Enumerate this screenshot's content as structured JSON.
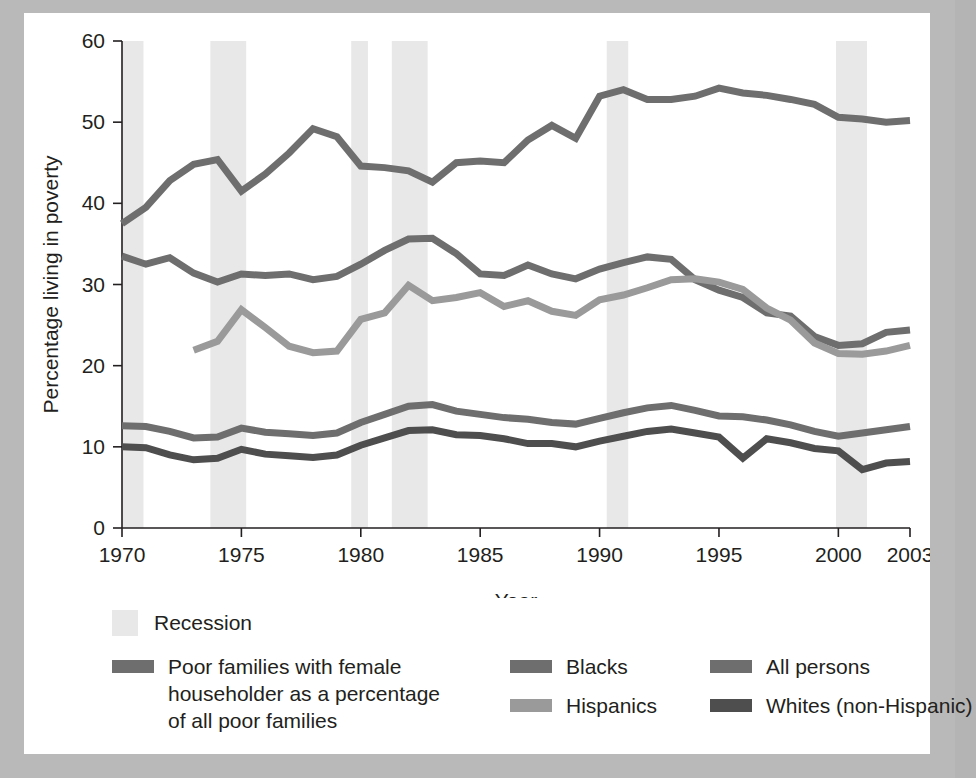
{
  "chart_data": {
    "type": "line",
    "title": "",
    "xlabel": "Year",
    "ylabel": "Percentage living in poverty",
    "xlim": [
      1970,
      2003
    ],
    "ylim": [
      0,
      60
    ],
    "xticks": [
      1970,
      1975,
      1980,
      1985,
      1990,
      1995,
      2000,
      2003
    ],
    "xtick_labels": [
      "1970",
      "1975",
      "1980",
      "1985",
      "1990",
      "1995",
      "2000",
      "2003"
    ],
    "yticks": [
      0,
      10,
      20,
      30,
      40,
      50,
      60
    ],
    "ytick_labels": [
      "0",
      "10",
      "20",
      "30",
      "40",
      "50",
      "60"
    ],
    "grid": false,
    "legend_position": "below",
    "recession_bands": [
      {
        "start": 1970.0,
        "end": 1970.9
      },
      {
        "start": 1973.7,
        "end": 1975.2
      },
      {
        "start": 1979.6,
        "end": 1980.3
      },
      {
        "start": 1981.3,
        "end": 1982.8
      },
      {
        "start": 1990.3,
        "end": 1991.2
      },
      {
        "start": 1999.9,
        "end": 2001.2
      }
    ],
    "series": [
      {
        "name": "Poor families with female householder as a percentage of all poor families",
        "color": "#6e6e6e",
        "x": [
          1970,
          1971,
          1972,
          1973,
          1974,
          1975,
          1976,
          1977,
          1978,
          1979,
          1980,
          1981,
          1982,
          1983,
          1984,
          1985,
          1986,
          1987,
          1988,
          1989,
          1990,
          1991,
          1992,
          1993,
          1994,
          1995,
          1996,
          1997,
          1998,
          1999,
          2000,
          2001,
          2002,
          2003
        ],
        "values": [
          37.5,
          39.5,
          42.8,
          44.8,
          45.4,
          41.5,
          43.6,
          46.2,
          49.2,
          48.2,
          44.6,
          44.4,
          44.0,
          42.6,
          45.0,
          45.2,
          45.0,
          47.8,
          49.6,
          48.0,
          53.2,
          54.0,
          52.8,
          52.8,
          53.2,
          54.2,
          53.6,
          53.3,
          52.8,
          52.2,
          50.6,
          50.4,
          50.0,
          50.2
        ]
      },
      {
        "name": "Blacks",
        "color": "#6e6e6e",
        "x": [
          1970,
          1971,
          1972,
          1973,
          1974,
          1975,
          1976,
          1977,
          1978,
          1979,
          1980,
          1981,
          1982,
          1983,
          1984,
          1985,
          1986,
          1987,
          1988,
          1989,
          1990,
          1991,
          1992,
          1993,
          1994,
          1995,
          1996,
          1997,
          1998,
          1999,
          2000,
          2001,
          2002,
          2003
        ],
        "values": [
          33.5,
          32.5,
          33.3,
          31.4,
          30.3,
          31.3,
          31.1,
          31.3,
          30.6,
          31.0,
          32.5,
          34.2,
          35.6,
          35.7,
          33.8,
          31.3,
          31.1,
          32.4,
          31.3,
          30.7,
          31.9,
          32.7,
          33.4,
          33.1,
          30.6,
          29.3,
          28.4,
          26.5,
          26.1,
          23.6,
          22.5,
          22.7,
          24.1,
          24.4
        ]
      },
      {
        "name": "Hispanics",
        "color": "#9a9a9a",
        "x": [
          1973,
          1974,
          1975,
          1976,
          1977,
          1978,
          1979,
          1980,
          1981,
          1982,
          1983,
          1984,
          1985,
          1986,
          1987,
          1988,
          1989,
          1990,
          1991,
          1992,
          1993,
          1994,
          1995,
          1996,
          1997,
          1998,
          1999,
          2000,
          2001,
          2002,
          2003
        ],
        "values": [
          21.9,
          23.0,
          26.9,
          24.7,
          22.4,
          21.6,
          21.8,
          25.7,
          26.5,
          29.9,
          28.0,
          28.4,
          29.0,
          27.3,
          28.0,
          26.7,
          26.2,
          28.1,
          28.7,
          29.6,
          30.6,
          30.7,
          30.3,
          29.4,
          27.1,
          25.6,
          22.8,
          21.5,
          21.4,
          21.8,
          22.5
        ]
      },
      {
        "name": "All persons",
        "color": "#6e6e6e",
        "x": [
          1970,
          1971,
          1972,
          1973,
          1974,
          1975,
          1976,
          1977,
          1978,
          1979,
          1980,
          1981,
          1982,
          1983,
          1984,
          1985,
          1986,
          1987,
          1988,
          1989,
          1990,
          1991,
          1992,
          1993,
          1994,
          1995,
          1996,
          1997,
          1998,
          1999,
          2000,
          2001,
          2002,
          2003
        ],
        "values": [
          12.6,
          12.5,
          11.9,
          11.1,
          11.2,
          12.3,
          11.8,
          11.6,
          11.4,
          11.7,
          13.0,
          14.0,
          15.0,
          15.2,
          14.4,
          14.0,
          13.6,
          13.4,
          13.0,
          12.8,
          13.5,
          14.2,
          14.8,
          15.1,
          14.5,
          13.8,
          13.7,
          13.3,
          12.7,
          11.9,
          11.3,
          11.7,
          12.1,
          12.5
        ]
      },
      {
        "name": "Whites (non-Hispanic)",
        "color": "#4e4e4e",
        "x": [
          1970,
          1971,
          1972,
          1973,
          1974,
          1975,
          1976,
          1977,
          1978,
          1979,
          1980,
          1981,
          1982,
          1983,
          1984,
          1985,
          1986,
          1987,
          1988,
          1989,
          1990,
          1991,
          1992,
          1993,
          1994,
          1995,
          1996,
          1997,
          1998,
          1999,
          2000,
          2001,
          2002,
          2003
        ],
        "values": [
          10.0,
          9.9,
          9.0,
          8.4,
          8.6,
          9.7,
          9.1,
          8.9,
          8.7,
          9.0,
          10.2,
          11.1,
          12.0,
          12.1,
          11.5,
          11.4,
          11.0,
          10.4,
          10.4,
          10.0,
          10.7,
          11.3,
          11.9,
          12.2,
          11.7,
          11.2,
          8.6,
          11.0,
          10.5,
          9.8,
          9.5,
          7.2,
          8.0,
          8.2
        ]
      }
    ]
  },
  "legend": {
    "recession_label": "Recession",
    "items": [
      {
        "label": "Poor families with female\nhouseholder as a percentage\nof all poor families",
        "color": "#6e6e6e"
      },
      {
        "label": "Blacks",
        "color": "#6e6e6e"
      },
      {
        "label": "Hispanics",
        "color": "#9a9a9a"
      },
      {
        "label": "All persons",
        "color": "#6e6e6e"
      },
      {
        "label": "Whites (non-Hispanic)",
        "color": "#4e4e4e"
      }
    ]
  }
}
